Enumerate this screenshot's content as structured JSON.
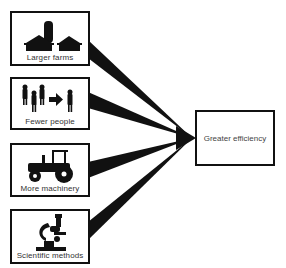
{
  "diagram": {
    "type": "convergent-arrows",
    "sources": [
      {
        "label": "Larger farms",
        "icon": "farm-buildings-icon"
      },
      {
        "label": "Fewer people",
        "icon": "people-reduction-icon"
      },
      {
        "label": "More machinery",
        "icon": "tractor-icon"
      },
      {
        "label": "Scientific methods",
        "icon": "microscope-icon"
      }
    ],
    "target": {
      "label": "Greater efficiency"
    },
    "colors": {
      "line": "#111111",
      "background": "#ffffff",
      "text": "#333333"
    }
  }
}
